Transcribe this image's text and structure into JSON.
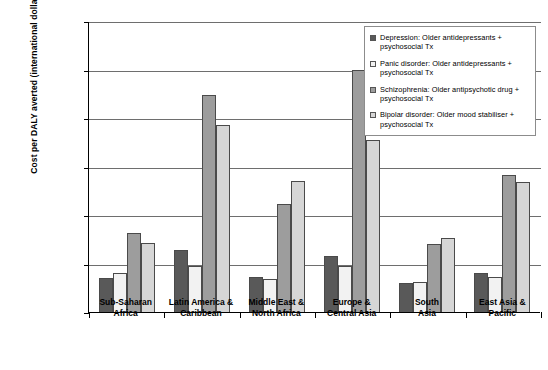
{
  "chart_data": {
    "type": "bar",
    "title": "",
    "xlabel": "",
    "ylabel": "Cost per DALY averted (international dollars)",
    "ylim": [
      0,
      12000
    ],
    "ytick_labels": [
      "12,000",
      "10,000",
      "8,000",
      "6,000",
      "4,000",
      "2,000",
      "0"
    ],
    "ytick_values": [
      12000,
      10000,
      8000,
      6000,
      4000,
      2000,
      0
    ],
    "grid": true,
    "legend_position": "top-right",
    "categories": [
      "Sub-Saharan\nAfrica",
      "Latin America &\nCaribbean",
      "Middle East &\nNorth Africa",
      "Europe &\nCentral Asia",
      "South\nAsia",
      "East Asia &\nPacific"
    ],
    "series": [
      {
        "name": "Depression: Older antidepressants + psychosocial Tx",
        "color": "#595959",
        "values": [
          1400,
          2550,
          1430,
          2300,
          1180,
          1620
        ]
      },
      {
        "name": "Panic disorder: Older antidepressants + psychosocial Tx",
        "color": "#f2f2f2",
        "values": [
          1600,
          1900,
          1380,
          1900,
          1220,
          1450
        ]
      },
      {
        "name": "Schizophrenia: Older antipsychotic drug + psychosocial Tx",
        "color": "#9d9d9d",
        "values": [
          3250,
          8950,
          4450,
          10000,
          2800,
          5650
        ]
      },
      {
        "name": "Bipolar disorder: Older mood stabiliser + psychosocial Tx",
        "color": "#d6d6d6",
        "values": [
          2850,
          7700,
          5400,
          7100,
          3050,
          5350
        ]
      }
    ]
  },
  "legend": {
    "entries": [
      "Depression: Older antidepressants + psychosocial Tx",
      "Panic disorder: Older antidepressants + psychosocial Tx",
      "Schizophrenia: Older antipsychotic drug + psychosocial Tx",
      "Bipolar disorder: Older mood stabiliser + psychosocial Tx"
    ]
  }
}
